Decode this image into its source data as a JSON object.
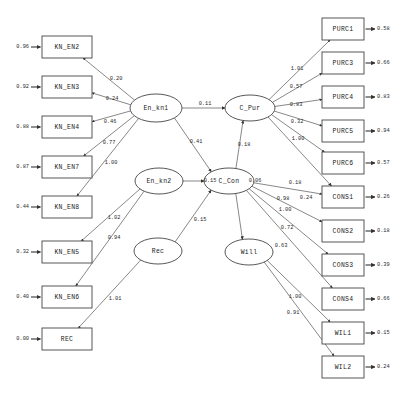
{
  "diagram": {
    "type": "sem-path-diagram",
    "title": "",
    "width": 406,
    "height": 395,
    "colors": {
      "background": "#ffffff",
      "node_stroke": "#444444",
      "edge_stroke": "#555555",
      "text": "#1a1a1a"
    }
  },
  "observed_left": [
    {
      "label": "KN_EN2",
      "error": "0.96",
      "x": 42,
      "y": 36,
      "w": 50,
      "h": 22
    },
    {
      "label": "KN_EN3",
      "error": "0.92",
      "x": 42,
      "y": 76,
      "w": 50,
      "h": 22
    },
    {
      "label": "KN_EN4",
      "error": "0.88",
      "x": 42,
      "y": 116,
      "w": 50,
      "h": 22
    },
    {
      "label": "KN_EN7",
      "error": "0.87",
      "x": 42,
      "y": 156,
      "w": 50,
      "h": 22
    },
    {
      "label": "KN_EN8",
      "error": "0.44",
      "x": 42,
      "y": 196,
      "w": 50,
      "h": 22
    },
    {
      "label": "KN_EN5",
      "error": "0.32",
      "x": 42,
      "y": 241,
      "w": 50,
      "h": 22
    },
    {
      "label": "KN_EN6",
      "error": "0.40",
      "x": 42,
      "y": 286,
      "w": 50,
      "h": 22
    },
    {
      "label": "REC",
      "error": "0.00",
      "x": 42,
      "y": 328,
      "w": 50,
      "h": 22
    }
  ],
  "observed_right": [
    {
      "label": "PURC1",
      "error": "0.58",
      "x": 322,
      "y": 18,
      "w": 42,
      "h": 22
    },
    {
      "label": "PURC3",
      "error": "0.66",
      "x": 322,
      "y": 52,
      "w": 42,
      "h": 22
    },
    {
      "label": "PURC4",
      "error": "0.83",
      "x": 322,
      "y": 86,
      "w": 42,
      "h": 22
    },
    {
      "label": "PURC5",
      "error": "0.94",
      "x": 322,
      "y": 120,
      "w": 42,
      "h": 22
    },
    {
      "label": "PURC6",
      "error": "0.57",
      "x": 322,
      "y": 152,
      "w": 42,
      "h": 22
    },
    {
      "label": "CONS1",
      "error": "0.26",
      "x": 322,
      "y": 186,
      "w": 42,
      "h": 22
    },
    {
      "label": "CONS2",
      "error": "0.18",
      "x": 322,
      "y": 220,
      "w": 42,
      "h": 22
    },
    {
      "label": "CONS3",
      "error": "0.39",
      "x": 322,
      "y": 254,
      "w": 42,
      "h": 22
    },
    {
      "label": "CONS4",
      "error": "0.66",
      "x": 322,
      "y": 288,
      "w": 42,
      "h": 22
    },
    {
      "label": "WIL1",
      "error": "0.15",
      "x": 322,
      "y": 322,
      "w": 42,
      "h": 22
    },
    {
      "label": "WIL2",
      "error": "0.24",
      "x": 322,
      "y": 356,
      "w": 42,
      "h": 22
    }
  ],
  "latents": [
    {
      "label": "En_kn1",
      "cx": 156,
      "cy": 108,
      "rx": 26,
      "ry": 14
    },
    {
      "label": "En_kn2",
      "cx": 159,
      "cy": 181,
      "rx": 24,
      "ry": 13
    },
    {
      "label": "Rec",
      "cx": 158,
      "cy": 251,
      "rx": 24,
      "ry": 13
    },
    {
      "label": "C_Pur",
      "cx": 250,
      "cy": 108,
      "rx": 25,
      "ry": 13
    },
    {
      "label": "C_Con",
      "cx": 229,
      "cy": 181,
      "rx": 25,
      "ry": 13
    },
    {
      "label": "Will",
      "cx": 249,
      "cy": 252,
      "rx": 24,
      "ry": 13
    }
  ],
  "loadings_left": [
    {
      "from": "En_kn1",
      "to": "KN_EN2",
      "value": "0.20",
      "lx": 116,
      "ly": 79
    },
    {
      "from": "En_kn1",
      "to": "KN_EN3",
      "value": "0.24",
      "lx": 112,
      "ly": 99
    },
    {
      "from": "En_kn1",
      "to": "KN_EN4",
      "value": "0.46",
      "lx": 110,
      "ly": 122
    },
    {
      "from": "En_kn1",
      "to": "KN_EN7",
      "value": "0.77",
      "lx": 109,
      "ly": 143
    },
    {
      "from": "En_kn1",
      "to": "KN_EN8",
      "value": "1.00",
      "lx": 111,
      "ly": 163
    },
    {
      "from": "En_kn2",
      "to": "KN_EN5",
      "value": "1.02",
      "lx": 114,
      "ly": 218
    },
    {
      "from": "En_kn2",
      "to": "KN_EN6",
      "value": "0.94",
      "lx": 114,
      "ly": 238
    },
    {
      "from": "Rec",
      "to": "REC",
      "value": "1.01",
      "lx": 115,
      "ly": 299
    }
  ],
  "loadings_right": [
    {
      "from": "C_Pur",
      "to": "PURC1",
      "value": "1.01",
      "lx": 297,
      "ly": 69
    },
    {
      "from": "C_Pur",
      "to": "PURC3",
      "value": "0.57",
      "lx": 296,
      "ly": 87
    },
    {
      "from": "C_Pur",
      "to": "PURC4",
      "value": "0.83",
      "lx": 296,
      "ly": 105
    },
    {
      "from": "C_Pur",
      "to": "PURC5",
      "value": "0.32",
      "lx": 297,
      "ly": 122
    },
    {
      "from": "C_Pur",
      "to": "PURC6",
      "value": "1.00",
      "lx": 298,
      "ly": 139
    },
    {
      "from": "C_Con",
      "to": "CONS1",
      "value": "0.18",
      "lx": 295,
      "ly": 183
    },
    {
      "from": "C_Con",
      "to": "CONS2",
      "value": "0.98",
      "lx": 283,
      "ly": 199
    },
    {
      "from": "C_Con",
      "to": "CONS3",
      "value": "1.00",
      "lx": 285,
      "ly": 210
    },
    {
      "from": "C_Con",
      "to": "CONS4",
      "value": "0.72",
      "lx": 287,
      "ly": 228
    },
    {
      "from": "Will",
      "to": "WIL1",
      "value": "1.00",
      "lx": 295,
      "ly": 297
    },
    {
      "from": "Will",
      "to": "WIL2",
      "value": "0.91",
      "lx": 293,
      "ly": 313
    }
  ],
  "structural_paths": [
    {
      "from": "En_kn1",
      "to": "C_Pur",
      "value": "0.11",
      "lx": 205,
      "ly": 104
    },
    {
      "from": "En_kn1",
      "to": "C_Con",
      "value": "0.41",
      "lx": 196,
      "ly": 142
    },
    {
      "from": "C_Con",
      "to": "C_Pur",
      "value": "0.18",
      "lx": 244,
      "ly": 145
    },
    {
      "from": "Rec",
      "to": "C_Con",
      "value": "0.15",
      "lx": 200,
      "ly": 220
    },
    {
      "from": "En_kn2",
      "to": "C_Con",
      "value": "0.15",
      "lx": 210,
      "ly": 181
    },
    {
      "from": "C_Con",
      "to": "Will",
      "value": "0.63",
      "lx": 281,
      "ly": 246
    },
    {
      "from": "C_Pur",
      "to": "CONS1",
      "value": "0.24",
      "lx": 306,
      "ly": 198
    },
    {
      "from": "C_Con",
      "to": "C_Pur_corr",
      "value": "0.06",
      "lx": 255,
      "ly": 181
    }
  ]
}
